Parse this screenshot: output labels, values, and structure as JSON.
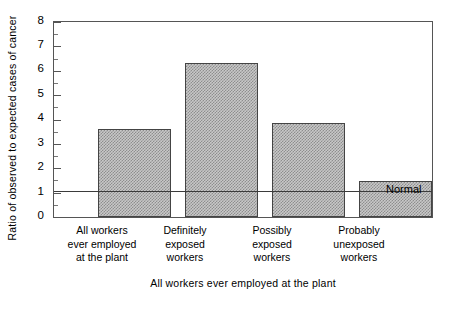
{
  "chart_data": {
    "type": "bar",
    "title": "",
    "xlabel": "All workers ever employed at the plant",
    "ylabel": "Ratio of observed to expected cases of cancer",
    "categories": [
      "All  workers\never  employed\nat  the  plant",
      "Definitely\nexposed\nworkers",
      "Possibly\nexposed\nworkers",
      "Probably\nunexposed\nworkers"
    ],
    "category_lines": [
      [
        "All  workers",
        "ever  employed",
        "at  the  plant"
      ],
      [
        "Definitely",
        "exposed",
        "workers"
      ],
      [
        "Possibly",
        "exposed",
        "workers"
      ],
      [
        "Probably",
        "unexposed",
        "workers"
      ]
    ],
    "values": [
      3.65,
      6.4,
      3.9,
      1.5
    ],
    "ylim": [
      0,
      8
    ],
    "xlim_note": "categorical, 4 bars",
    "yticks": [
      0,
      1,
      2,
      3,
      4,
      5,
      6,
      7,
      8
    ],
    "ytick_labels": [
      "0",
      "1",
      "2",
      "3",
      "4",
      "5",
      "6",
      "7",
      "8"
    ],
    "yminor_ticks": [
      0.5,
      1.5,
      2.5,
      3.5,
      4.5,
      5.5,
      6.5,
      7.5
    ],
    "grid": false,
    "legend": "none",
    "annotations": [
      {
        "name": "normal-reference-line",
        "label": "Normal",
        "y": 1.0,
        "style": "horizontal reference line across plot"
      }
    ],
    "bar_fill": "#c8c8c8",
    "bar_pattern": "checkerboard-dither",
    "bar_edge_color": "#444444",
    "axis_color": "#555555",
    "background": "#ffffff"
  },
  "axis": {
    "y_title": "Ratio of observed to expected cases of cancer",
    "x_title": "All workers ever employed at the plant"
  },
  "normal": {
    "label": "Normal"
  }
}
